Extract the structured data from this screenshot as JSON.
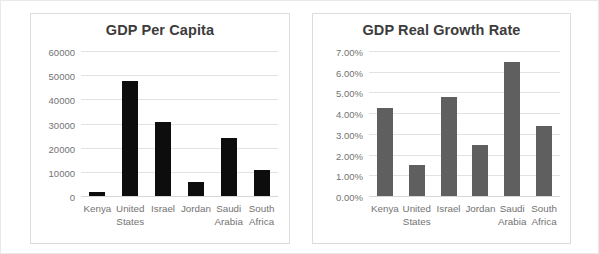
{
  "chart_data": [
    {
      "type": "bar",
      "title": "GDP Per Capita",
      "categories": [
        "Kenya",
        "United States",
        "Israel",
        "Jordan",
        "Saudi Arabia",
        "South Africa"
      ],
      "values": [
        1700,
        48000,
        31000,
        6000,
        24000,
        11000
      ],
      "xlabel": "",
      "ylabel": "",
      "ylim": [
        0,
        60000
      ],
      "yticks": [
        "0",
        "10000",
        "20000",
        "30000",
        "40000",
        "50000",
        "60000"
      ],
      "ytick_values": [
        0,
        10000,
        20000,
        30000,
        40000,
        50000,
        60000
      ],
      "grid": true,
      "legend": "none",
      "bar_color": "#0d0d0d"
    },
    {
      "type": "bar",
      "title": "GDP Real Growth Rate",
      "categories": [
        "Kenya",
        "United States",
        "Israel",
        "Jordan",
        "Saudi Arabia",
        "South Africa"
      ],
      "values": [
        4.3,
        1.5,
        4.8,
        2.5,
        6.5,
        3.4
      ],
      "value_labels": [
        "4.30%",
        "1.50%",
        "4.80%",
        "2.50%",
        "6.50%",
        "3.40%"
      ],
      "xlabel": "",
      "ylabel": "",
      "ylim": [
        0,
        7
      ],
      "yticks": [
        "0.00%",
        "1.00%",
        "2.00%",
        "3.00%",
        "4.00%",
        "5.00%",
        "6.00%",
        "7.00%"
      ],
      "ytick_values": [
        0,
        1,
        2,
        3,
        4,
        5,
        6,
        7
      ],
      "grid": true,
      "legend": "none",
      "bar_color": "#5f5f5f"
    }
  ],
  "colors": {
    "page_background": "#ffffff",
    "card_border": "#dcdcdc",
    "gridline": "#e2e2e2",
    "tick_text": "#737373",
    "title_text": "#3c3c3c"
  }
}
